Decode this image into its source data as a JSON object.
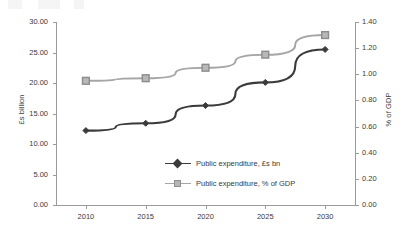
{
  "chart_data": {
    "type": "line",
    "title": "",
    "xlabel": "",
    "categories": [
      "2010",
      "2015",
      "2020",
      "2025",
      "2030"
    ],
    "grid": false,
    "legend_position": "center-inside",
    "axes": {
      "left": {
        "label": "£s billion",
        "ylim": [
          0,
          30
        ],
        "tick_step": 5,
        "ticks": [
          "0.00",
          "5.00",
          "10.00",
          "15.00",
          "20.00",
          "25.00",
          "30.00"
        ]
      },
      "right": {
        "label": "% of GDP",
        "ylim": [
          0,
          1.4
        ],
        "tick_step": 0.2,
        "ticks": [
          "0.00",
          "0.20",
          "0.40",
          "0.60",
          "0.80",
          "1.00",
          "1.20",
          "1.40"
        ]
      }
    },
    "series": [
      {
        "name": "Public expenditure, £s bn",
        "axis": "left",
        "color": "#3b3b3b",
        "marker": "diamond",
        "values": [
          12.2,
          13.4,
          16.3,
          20.1,
          25.5
        ]
      },
      {
        "name": "Public expenditure, % of GDP",
        "axis": "right",
        "color": "#a6a6a6",
        "marker": "square",
        "values": [
          0.95,
          0.97,
          1.05,
          1.15,
          1.3
        ]
      }
    ]
  },
  "legend": {
    "items": [
      {
        "label": "Public expenditure, £s bn"
      },
      {
        "label": "Public expenditure, % of GDP"
      }
    ]
  }
}
